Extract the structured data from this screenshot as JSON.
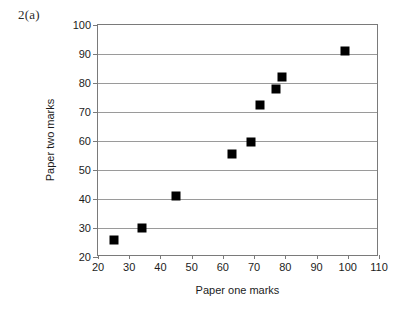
{
  "question_label": "2(a)",
  "chart_data": {
    "type": "scatter",
    "title": "",
    "xlabel": "Paper one marks",
    "ylabel": "Paper two marks",
    "xlim": [
      20,
      110
    ],
    "ylim": [
      20,
      100
    ],
    "xticks": [
      20,
      30,
      40,
      50,
      60,
      70,
      80,
      90,
      100,
      110
    ],
    "yticks": [
      20,
      30,
      40,
      50,
      60,
      70,
      80,
      90,
      100
    ],
    "grid": "horizontal",
    "legend": "none",
    "marker": "filled-square",
    "marker_color": "#000000",
    "points": [
      {
        "x": 25,
        "y": 26
      },
      {
        "x": 34,
        "y": 30
      },
      {
        "x": 45,
        "y": 41
      },
      {
        "x": 63,
        "y": 55.5
      },
      {
        "x": 69,
        "y": 59.5
      },
      {
        "x": 72,
        "y": 72.5
      },
      {
        "x": 77,
        "y": 78
      },
      {
        "x": 79,
        "y": 82
      },
      {
        "x": 99,
        "y": 91
      }
    ]
  }
}
